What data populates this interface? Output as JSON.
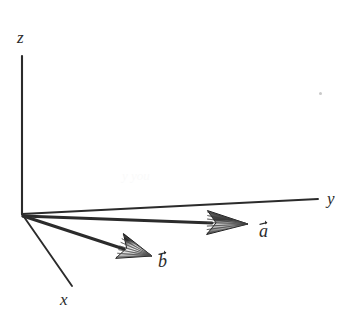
{
  "figure": {
    "background_color": "#ffffff",
    "ink_color": "#2b2b2b",
    "width": 351,
    "height": 318
  },
  "axes": [
    {
      "name": "z-axis",
      "label": "z",
      "label_x": 17,
      "label_y": 29,
      "from": {
        "x": 22,
        "y": 214
      },
      "to": {
        "x": 22,
        "y": 56
      },
      "stroke_width": 2.1
    },
    {
      "name": "y-axis",
      "label": "y",
      "label_x": 327,
      "label_y": 190,
      "from": {
        "x": 22,
        "y": 214
      },
      "to": {
        "x": 318,
        "y": 199
      },
      "stroke_width": 1.9
    },
    {
      "name": "x-axis",
      "label": "x",
      "label_x": 60,
      "label_y": 291,
      "from": {
        "x": 22,
        "y": 214
      },
      "to": {
        "x": 72,
        "y": 286
      },
      "stroke_width": 1.9
    }
  ],
  "vectors": [
    {
      "name": "vector-a",
      "label": "a",
      "label_x": 259,
      "label_y": 220,
      "shaft_from": {
        "x": 23,
        "y": 216
      },
      "shaft_to": {
        "x": 212,
        "y": 223
      },
      "tip": {
        "x": 248,
        "y": 224
      },
      "head_length": 41,
      "head_half_width": 12,
      "stroke_width": 3.0
    },
    {
      "name": "vector-b",
      "label": "b",
      "label_x": 158,
      "label_y": 250,
      "shaft_from": {
        "x": 23,
        "y": 216
      },
      "shaft_to": {
        "x": 124,
        "y": 249
      },
      "tip": {
        "x": 152,
        "y": 256
      },
      "head_length": 34,
      "head_half_width": 13,
      "stroke_width": 3.0
    }
  ],
  "artifacts": {
    "speck": {
      "x": 319,
      "y": 92,
      "size": 3,
      "color": "#c9c9c9"
    },
    "ghost_text": {
      "text": "y                  you",
      "x": 122,
      "y": 168,
      "size": 13
    }
  }
}
